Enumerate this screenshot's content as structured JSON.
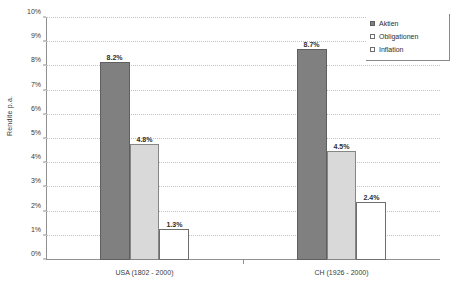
{
  "chart_data": {
    "type": "bar",
    "title": "",
    "xlabel": "",
    "ylabel": "Rendite p.a.",
    "categories": [
      "USA (1802 - 2000)",
      "CH (1926 - 2000)"
    ],
    "series": [
      {
        "name": "Aktien",
        "color": "#808080",
        "values": [
          8.2,
          8.7
        ],
        "labels": [
          "8.2%",
          "8.7%"
        ]
      },
      {
        "name": "Obligationen",
        "color": "#d9d9d9",
        "values": [
          4.8,
          4.5
        ],
        "labels": [
          "4.8%",
          "4.5%"
        ]
      },
      {
        "name": "Inflation",
        "color": "#ffffff",
        "values": [
          1.3,
          2.4
        ],
        "labels": [
          "1.3%",
          "2.4%"
        ]
      }
    ],
    "ylim": [
      0,
      10
    ],
    "ytick_step": 1,
    "ytick_labels": [
      "0%",
      "1%",
      "2%",
      "3%",
      "4%",
      "5%",
      "6%",
      "7%",
      "8%",
      "9%",
      "10%"
    ],
    "grid": true,
    "grid_style": "dotted-horizontal",
    "legend_position": "top-right",
    "legend_entries": [
      "Aktien",
      "Obligationen",
      "Inflation"
    ]
  }
}
